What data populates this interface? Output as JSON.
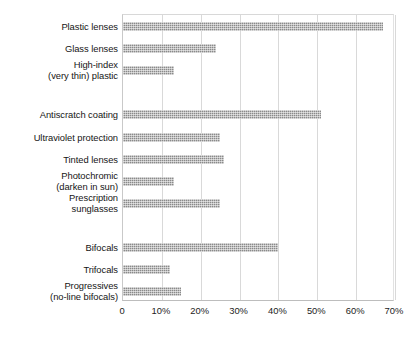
{
  "chart_data": {
    "type": "bar",
    "orientation": "horizontal",
    "title": "",
    "subtitle": "",
    "xlabel": "",
    "ylabel": "",
    "xlim": [
      0,
      70
    ],
    "grid": true,
    "legend": null,
    "xticks": [
      "0",
      "10%",
      "20%",
      "30%",
      "40%",
      "50%",
      "60%",
      "70%"
    ],
    "xtick_values": [
      0,
      10,
      20,
      30,
      40,
      50,
      60,
      70
    ],
    "categories": [
      "Plastic lenses",
      "Glass lenses",
      "High-index\n(very thin) plastic",
      "",
      "Antiscratch coating",
      "Ultraviolet protection",
      "Tinted lenses",
      "Photochromic\n(darken in sun)",
      "Prescription\nsunglasses",
      "",
      "Bifocals",
      "Trifocals",
      "Progressives\n(no-line bifocals)"
    ],
    "values": [
      67,
      24,
      13,
      null,
      51,
      25,
      26,
      13,
      25,
      null,
      40,
      12,
      15
    ],
    "bar_color": "#8a8a8a",
    "grid_color": "#d9d9d9",
    "background_color": "#ffffff"
  }
}
